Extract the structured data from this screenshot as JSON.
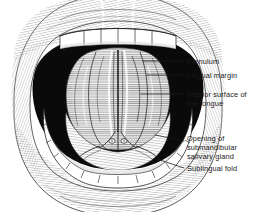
{
  "figure": {
    "background_color": "#ffffff",
    "ink_color": "#1a1a1a",
    "style": "pen-and-ink line engraving"
  },
  "labels": [
    {
      "id": "frenulum",
      "text": "Frenulum",
      "x": 187,
      "y": 57,
      "leader": {
        "x1": 184,
        "y1": 61,
        "x2": 143,
        "y2": 61
      }
    },
    {
      "id": "lingual-margin",
      "text": "Lingual margin",
      "x": 187,
      "y": 71,
      "leader": {
        "x1": 184,
        "y1": 75,
        "x2": 147,
        "y2": 75
      }
    },
    {
      "id": "inferior-surface-of-the-tongue",
      "text": "Inferior surface of\nthe tongue",
      "x": 187,
      "y": 90,
      "leader": {
        "x1": 184,
        "y1": 94,
        "x2": 141,
        "y2": 94
      }
    },
    {
      "id": "opening-of-submandibular-salivary-gland",
      "text": "Opening of\nsubmandibular\nsalivary gland",
      "x": 187,
      "y": 134,
      "leader": {
        "x1": 184,
        "y1": 141,
        "x2": 155,
        "y2": 135
      }
    },
    {
      "id": "sublingual-fold",
      "text": "Sublingual fold",
      "x": 187,
      "y": 164,
      "leader": {
        "x1": 184,
        "y1": 168,
        "x2": 157,
        "y2": 159
      }
    }
  ],
  "anatomy_parts": [
    {
      "id": "upper-lip",
      "name": "Upper lip"
    },
    {
      "id": "lower-lip",
      "name": "Lower lip"
    },
    {
      "id": "upper-teeth",
      "name": "Upper incisors"
    },
    {
      "id": "lower-teeth",
      "name": "Lower dental arch"
    },
    {
      "id": "oral-vestibule-shadow",
      "name": "Oral vestibule shadow"
    },
    {
      "id": "tongue-inferior-surface",
      "name": "Inferior surface of tongue"
    },
    {
      "id": "lingual-frenulum",
      "name": "Lingual frenulum"
    },
    {
      "id": "sublingual-fold",
      "name": "Sublingual fold"
    },
    {
      "id": "submandibular-duct-opening",
      "name": "Submandibular duct opening"
    }
  ]
}
